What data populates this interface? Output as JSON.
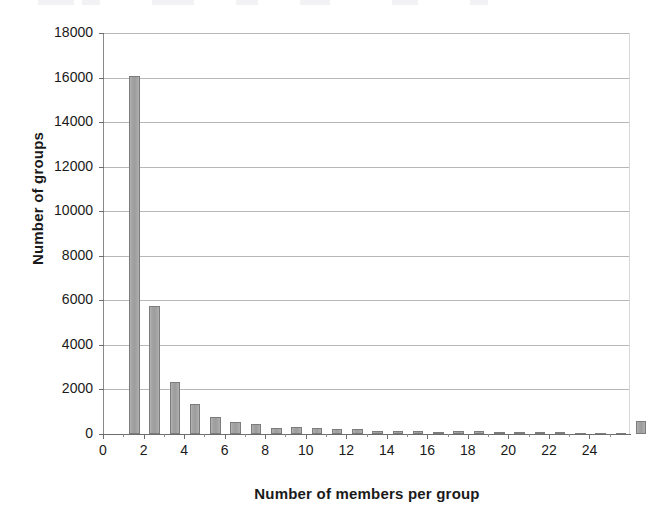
{
  "figure": {
    "width": 661,
    "height": 528,
    "background": "#ffffff",
    "bar_color": "#a3a3a3",
    "bar_edge_color": "#7c7c7c",
    "gridline_color": "#b7b7b7",
    "axis_color": "#6d6d6d"
  },
  "chart_data": {
    "type": "bar",
    "title": "",
    "xlabel": "Number of members per group",
    "ylabel": "Number of groups",
    "xlim": [
      0,
      26
    ],
    "ylim": [
      0,
      18000
    ],
    "grid": "horizontal",
    "legend": "none",
    "y_ticks": [
      0,
      2000,
      4000,
      6000,
      8000,
      10000,
      12000,
      14000,
      16000,
      18000
    ],
    "y_tick_labels": [
      "0",
      "2000",
      "4000",
      "6000",
      "8000",
      "10000",
      "12000",
      "14000",
      "16000",
      "18000"
    ],
    "x_ticks_major": [
      0,
      2,
      4,
      6,
      8,
      10,
      12,
      14,
      16,
      18,
      20,
      22,
      24
    ],
    "x_tick_labels": [
      "0",
      "2",
      "4",
      "6",
      "8",
      "10",
      "12",
      "14",
      "16",
      "18",
      "20",
      "22",
      "24"
    ],
    "x_ticks_minor": [
      1,
      3,
      5,
      7,
      9,
      11,
      13,
      15,
      17,
      19,
      21,
      23,
      25
    ],
    "categories": [
      1,
      2,
      3,
      4,
      5,
      6,
      7,
      8,
      9,
      10,
      11,
      12,
      13,
      14,
      15,
      16,
      17,
      18,
      19,
      20,
      21,
      22,
      23,
      24,
      25,
      26
    ],
    "values": [
      16050,
      5750,
      2350,
      1330,
      780,
      540,
      440,
      290,
      300,
      260,
      215,
      210,
      130,
      140,
      135,
      95,
      130,
      140,
      70,
      70,
      75,
      70,
      65,
      60,
      55,
      600
    ],
    "note_last_bar": "final bar at x=26 represents groups with 26 or more members"
  }
}
